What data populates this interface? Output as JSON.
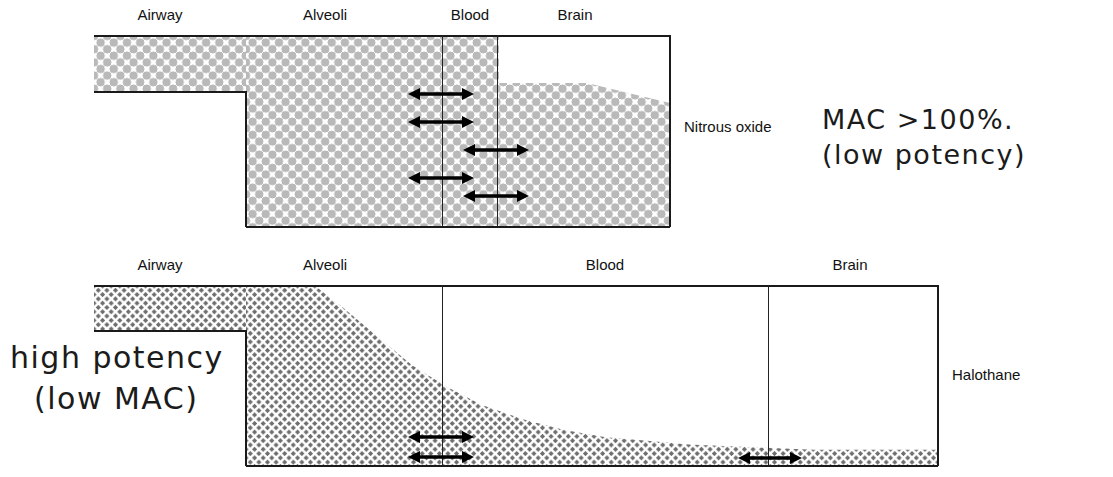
{
  "panels": [
    {
      "id": "nitrous-oxide",
      "agent_label": "Nitrous oxide",
      "column_labels": [
        "Airway",
        "Alveoli",
        "Blood",
        "Brain"
      ],
      "molecule_style": "large-pale-gray",
      "molecule_color": "#b9b9b9",
      "description": "Molecules fill all compartments to near equal high density",
      "arrow_count": 5,
      "arrows": [
        {
          "id": "a1",
          "boundary": "alveoli-blood",
          "direction": "double"
        },
        {
          "id": "a2",
          "boundary": "alveoli-blood",
          "direction": "double"
        },
        {
          "id": "a3",
          "boundary": "blood-brain",
          "direction": "double"
        },
        {
          "id": "a4",
          "boundary": "alveoli-blood",
          "direction": "double"
        },
        {
          "id": "a5",
          "boundary": "blood-brain",
          "direction": "double"
        }
      ]
    },
    {
      "id": "halothane",
      "agent_label": "Halothane",
      "column_labels": [
        "Airway",
        "Alveoli",
        "Blood",
        "Brain"
      ],
      "molecule_style": "small-dark-gray",
      "molecule_color": "#6e6e6e",
      "description": "Molecule density falls steeply from airway through alveoli to a thin layer in blood and brain",
      "arrow_count": 3,
      "arrows": [
        {
          "id": "b1",
          "boundary": "alveoli-blood",
          "direction": "double"
        },
        {
          "id": "b2",
          "boundary": "alveoli-blood",
          "direction": "double"
        },
        {
          "id": "b3",
          "boundary": "blood-brain",
          "direction": "double"
        }
      ]
    }
  ],
  "annotations": {
    "nitrous_oxide": {
      "line1": "MAC >100%.",
      "line2": "(low potency)"
    },
    "halothane": {
      "line1": "high potency",
      "line2": "(low MAC)"
    }
  }
}
